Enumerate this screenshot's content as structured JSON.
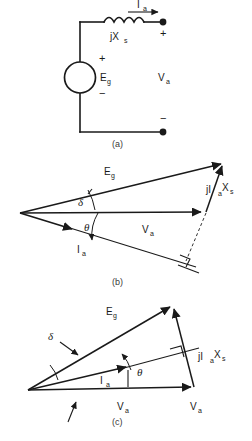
{
  "figure": {
    "title_visible": false,
    "background_color": "#ffffff",
    "ink_color": "#1a1a1a"
  },
  "circuit": {
    "caption": "(a)",
    "labels": {
      "current": "I",
      "current_sub": "a",
      "reactance": "jX",
      "reactance_sub": "s",
      "source": "E",
      "source_sub": "g",
      "terminal_voltage": "V",
      "terminal_voltage_sub": "a"
    },
    "signs": {
      "terminal_plus": "+",
      "terminal_minus": "−",
      "source_plus": "+",
      "source_minus": "−"
    },
    "icons": {
      "inductor": "inductor-coil-icon",
      "source": "voltage-source-circle-icon",
      "terminal": "terminal-node-icon",
      "arrow": "current-direction-arrow-icon"
    }
  },
  "phasor_b": {
    "caption": "(b)",
    "power_factor": "lagging",
    "labels": {
      "eg": "E",
      "eg_sub": "g",
      "va": "V",
      "va_sub": "a",
      "ia": "I",
      "ia_sub": "a",
      "drop": "jI",
      "drop_sub1": "a",
      "drop_mid": "X",
      "drop_sub2": "s",
      "delta": "δ",
      "theta": "θ"
    },
    "icons": {
      "right_angle": "right-angle-marker-icon",
      "arc_delta": "angle-arc-icon",
      "arc_theta": "angle-arc-icon"
    }
  },
  "phasor_c": {
    "caption": "(c)",
    "power_factor": "leading",
    "labels": {
      "eg": "E",
      "eg_sub": "g",
      "va": "V",
      "va_sub": "a",
      "va_tip": "V",
      "va_tip_sub": "a",
      "ia": "I",
      "ia_sub": "a",
      "drop": "jI",
      "drop_sub1": "a",
      "drop_mid": "X",
      "drop_sub2": "s",
      "delta": "δ",
      "theta": "θ"
    },
    "icons": {
      "right_angle": "right-angle-marker-icon",
      "pointer": "reference-pointer-arrow-icon",
      "delta_leader": "leader-line-icon"
    }
  }
}
